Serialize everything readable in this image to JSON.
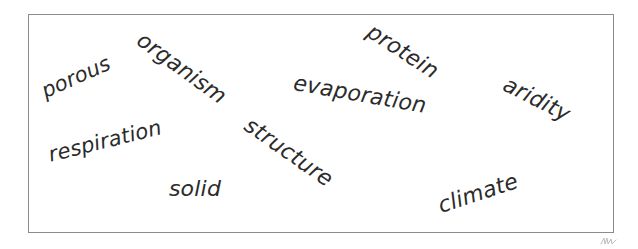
{
  "canvas": {
    "width": 638,
    "height": 249,
    "background_color": "#ffffff"
  },
  "frame": {
    "name": "word-field-border",
    "border_color": "#8c8c8c",
    "border_width_px": 1,
    "left": 28,
    "top": 14,
    "width": 586,
    "height": 219
  },
  "marks": {
    "corner_scribble_label": ""
  },
  "word_cloud": {
    "text_color": "#2b2b2b",
    "count": 10,
    "words": [
      {
        "label": "porous",
        "x": 76,
        "y": 77,
        "rotation_deg": -24,
        "font_size_px": 21
      },
      {
        "label": "organism",
        "x": 182,
        "y": 68,
        "rotation_deg": 36,
        "font_size_px": 22
      },
      {
        "label": "protein",
        "x": 403,
        "y": 51,
        "rotation_deg": 33,
        "font_size_px": 22
      },
      {
        "label": "evaporation",
        "x": 360,
        "y": 94,
        "rotation_deg": 10,
        "font_size_px": 22
      },
      {
        "label": "aridity",
        "x": 537,
        "y": 99,
        "rotation_deg": 27,
        "font_size_px": 22
      },
      {
        "label": "respiration",
        "x": 105,
        "y": 141,
        "rotation_deg": -14,
        "font_size_px": 21
      },
      {
        "label": "structure",
        "x": 289,
        "y": 152,
        "rotation_deg": 35,
        "font_size_px": 22
      },
      {
        "label": "solid",
        "x": 195,
        "y": 188,
        "rotation_deg": 0,
        "font_size_px": 22
      },
      {
        "label": "climate",
        "x": 478,
        "y": 193,
        "rotation_deg": -18,
        "font_size_px": 22
      }
    ]
  }
}
